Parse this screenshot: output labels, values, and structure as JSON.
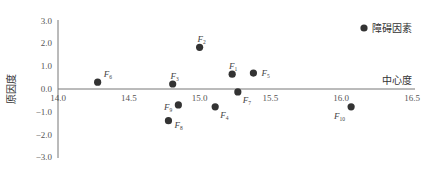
{
  "chart_data": {
    "type": "scatter",
    "title": "",
    "xlabel": "中心度",
    "ylabel": "原因度",
    "xlim": [
      14.0,
      16.5
    ],
    "ylim": [
      -3.0,
      3.0
    ],
    "x_ticks": [
      "14.0",
      "14.5",
      "15.0",
      "15.5",
      "16.0",
      "16.5"
    ],
    "y_ticks": [
      "3.0",
      "2.0",
      "1.0",
      "0.0",
      "-1.0",
      "-2.0",
      "-3.0"
    ],
    "grid": false,
    "legend": {
      "position": "top-right",
      "entries": [
        "障碍因素"
      ]
    },
    "series": [
      {
        "name": "障碍因素",
        "color": "#333333",
        "points": [
          {
            "label": "F",
            "sub": "1",
            "x": 15.23,
            "y": 0.65,
            "lx": 5,
            "ly": -8,
            "anchor": "end"
          },
          {
            "label": "F",
            "sub": "2",
            "x": 15.0,
            "y": 1.83,
            "lx": 2,
            "ly": -8,
            "anchor": "middle"
          },
          {
            "label": "F",
            "sub": "3",
            "x": 14.81,
            "y": 0.22,
            "lx": 2,
            "ly": -8,
            "anchor": "middle"
          },
          {
            "label": "F",
            "sub": "4",
            "x": 15.11,
            "y": -0.78,
            "lx": 5,
            "ly": 8,
            "anchor": "start"
          },
          {
            "label": "F",
            "sub": "5",
            "x": 15.38,
            "y": 0.7,
            "lx": 8,
            "ly": 0,
            "anchor": "start"
          },
          {
            "label": "F",
            "sub": "6",
            "x": 14.28,
            "y": 0.3,
            "lx": 6,
            "ly": -8,
            "anchor": "start"
          },
          {
            "label": "F",
            "sub": "7",
            "x": 15.27,
            "y": -0.13,
            "lx": 5,
            "ly": 8,
            "anchor": "start"
          },
          {
            "label": "F",
            "sub": "8",
            "x": 14.78,
            "y": -1.39,
            "lx": 6,
            "ly": 4,
            "anchor": "start"
          },
          {
            "label": "F",
            "sub": "9",
            "x": 14.85,
            "y": -0.7,
            "lx": -6,
            "ly": 2,
            "anchor": "end"
          },
          {
            "label": "F",
            "sub": "10",
            "x": 16.07,
            "y": -0.78,
            "lx": -6,
            "ly": 9,
            "anchor": "end"
          }
        ]
      }
    ]
  },
  "layout": {
    "origin_px": [
      58,
      89
    ],
    "x_px_per_unit": 141.6,
    "y_px_per_unit": 22.8,
    "y_axis_top": 20,
    "y_axis_bottom": 158,
    "x_axis_right": 415
  }
}
